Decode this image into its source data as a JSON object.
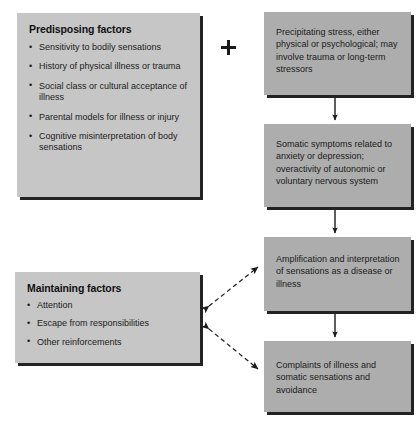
{
  "figure": {
    "type": "flow-diagram",
    "colors": {
      "box_fill_light": "#c6c6c6",
      "box_fill_dark": "#adadad",
      "box_shadow": "#232323",
      "text": "#1b1b1b",
      "arrow": "#1b1b1b",
      "background": "#ffffff"
    }
  },
  "connectors": {
    "plus_label": "+",
    "solid_arrows": [
      {
        "name": "precipitating-to-somatic",
        "from": "box-precipitating",
        "to": "box-somatic",
        "style": "solid",
        "heads": "single"
      },
      {
        "name": "somatic-to-amplification",
        "from": "box-somatic",
        "to": "box-amplification",
        "style": "solid",
        "heads": "single"
      },
      {
        "name": "amplification-to-complaints",
        "from": "box-amplification",
        "to": "box-complaints",
        "style": "solid",
        "heads": "single"
      }
    ],
    "dashed_arrows": [
      {
        "name": "maintaining-to-amplification",
        "from": "box-maintaining",
        "to": "box-amplification",
        "style": "dashed",
        "heads": "double"
      },
      {
        "name": "maintaining-to-complaints",
        "from": "box-maintaining",
        "to": "box-complaints",
        "style": "dashed",
        "heads": "double"
      }
    ]
  },
  "boxes": {
    "predisposing": {
      "title": "Predisposing factors",
      "items": [
        "Sensitivity to bodily sensations",
        "History of physical illness or trauma",
        "Social class or cultural acceptance of illness",
        "Parental models for illness or injury",
        "Cognitive misinterpretation of body sensations"
      ]
    },
    "maintaining": {
      "title": "Maintaining factors",
      "items": [
        "Attention",
        "Escape from responsibilities",
        "Other reinforcements"
      ]
    },
    "precipitating": {
      "text": "Precipitating stress, either physical or psychological; may involve trauma or long-term stressors"
    },
    "somatic": {
      "text": "Somatic symptoms related to anxiety or depression; overactivity of autonomic or voluntary nervous system"
    },
    "amplification": {
      "text": "Amplification and interpretation of sensations as a disease or illness"
    },
    "complaints": {
      "text": "Complaints of illness and somatic sensations and avoidance"
    }
  }
}
